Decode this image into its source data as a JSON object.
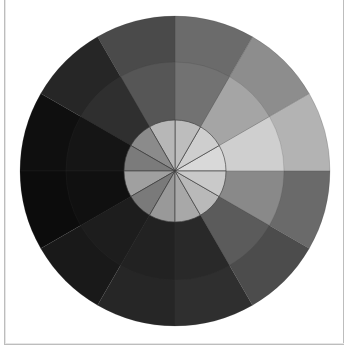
{
  "wheel": {
    "center": [
      175,
      171
    ],
    "radii": {
      "inner": 51,
      "middle": 109,
      "outer": 155
    },
    "sector_count": 12,
    "sector_angle_deg": 30,
    "divider_color": "#3a3a3a",
    "sectors": [
      {
        "start_deg": 0,
        "inner": "#d9d9d9",
        "middle": "#cfcfcf",
        "outer": "#b3b3b3"
      },
      {
        "start_deg": 30,
        "inner": "#cecece",
        "middle": "#a5a5a5",
        "outer": "#8d8d8d"
      },
      {
        "start_deg": 60,
        "inner": "#bdbdbd",
        "middle": "#727272",
        "outer": "#6b6b6b"
      },
      {
        "start_deg": 90,
        "inner": "#b7b7b7",
        "middle": "#565656",
        "outer": "#4a4a4a"
      },
      {
        "start_deg": 120,
        "inner": "#8b8b8b",
        "middle": "#2f2f2f",
        "outer": "#262626"
      },
      {
        "start_deg": 150,
        "inner": "#7b7b7b",
        "middle": "#151515",
        "outer": "#0f0f0f"
      },
      {
        "start_deg": 180,
        "inner": "#a0a0a0",
        "middle": "#101010",
        "outer": "#0c0c0c"
      },
      {
        "start_deg": 210,
        "inner": "#7a7a7a",
        "middle": "#1d1d1d",
        "outer": "#191919"
      },
      {
        "start_deg": 240,
        "inner": "#999999",
        "middle": "#222222",
        "outer": "#262626"
      },
      {
        "start_deg": 270,
        "inner": "#a8a8a8",
        "middle": "#292929",
        "outer": "#2f2f2f"
      },
      {
        "start_deg": 300,
        "inner": "#b9b9b9",
        "middle": "#5b5b5b",
        "outer": "#4c4c4c"
      },
      {
        "start_deg": 330,
        "inner": "#c9c9c9",
        "middle": "#898989",
        "outer": "#6a6a6a"
      }
    ]
  }
}
